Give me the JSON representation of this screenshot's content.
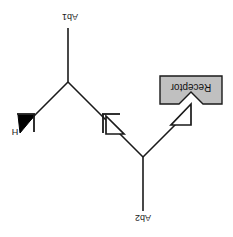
{
  "diagram": {
    "orientation_degrees": 180,
    "background_color": "#ffffff",
    "line_color": "#1a1a1a",
    "receptor_fill_color": "#c0c0c0",
    "labels": {
      "ab1": "Ab1",
      "ab2": "Ab2",
      "hormone": "H",
      "receptor": "Receptor"
    },
    "nodes": [
      {
        "name": "ab1-label",
        "text": "Ab1",
        "x": 70,
        "y": 17
      },
      {
        "name": "ab2-label",
        "text": "Ab2",
        "x": 143,
        "y": 218
      },
      {
        "name": "hormone-label",
        "text": "H",
        "x": 15,
        "y": 132
      },
      {
        "name": "receptor-label",
        "text": "Receptor",
        "x": 191,
        "y": 88
      }
    ],
    "shapes": {
      "ab1_stem": {
        "x1": 68,
        "y1": 28,
        "x2": 68,
        "y2": 82
      },
      "ab1_arm_left": {
        "x1": 68,
        "y1": 82,
        "x2": 32,
        "y2": 118
      },
      "ab1_arm_right": {
        "x1": 68,
        "y1": 82,
        "x2": 104,
        "y2": 118
      },
      "ab2_stem": {
        "x1": 143,
        "y1": 210,
        "x2": 143,
        "y2": 157
      },
      "ab2_arm_left": {
        "x1": 143,
        "y1": 157,
        "x2": 110,
        "y2": 124
      },
      "ab2_arm_right": {
        "x1": 143,
        "y1": 157,
        "x2": 180,
        "y2": 120
      },
      "hormone_arrowhead": {
        "type": "filled-triangle",
        "fill": "#000000"
      },
      "ab2_left_arrowhead": {
        "type": "open-triangle",
        "fill": "#ffffff"
      },
      "ab2_right_arrowhead": {
        "type": "open-triangle",
        "fill": "#ffffff"
      },
      "receptor_box": {
        "x": 160,
        "y": 76,
        "width": 62,
        "height": 28,
        "fill": "#c0c0c0",
        "stroke": "#1a1a1a",
        "notch": "v-notch-bottom-center"
      }
    }
  }
}
